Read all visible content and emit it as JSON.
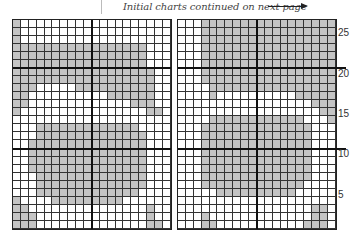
{
  "caption": {
    "text": "Initial charts continued on next page",
    "arrow": "right-arrow"
  },
  "colors": {
    "filled": "#c4c4c4",
    "empty": "#ffffff",
    "grid": "#333333"
  },
  "chart_data": [
    {
      "type": "table",
      "name": "left-chart",
      "columns": 20,
      "rows": 26,
      "legend": {
        "1": "filled (gray)",
        "0": "empty (white)"
      },
      "grid_top_to_bottom": [
        "10000000000000000000",
        "10000000000000000000",
        "10000000000000000000",
        "11111111111111111000",
        "11111111111111111000",
        "11111111111111111000",
        "11111111111111111100",
        "11111111111111111100",
        "11100000111111111100",
        "11000000000011111100",
        "11000000000000011100",
        "10000000000000000110",
        "00000000000000000000",
        "00011111111111110000",
        "00011111111111111000",
        "00111111111111111000",
        "00111111111111111000",
        "00111111111111111000",
        "00111111111111111000",
        "00011111111111111000",
        "00011111111111111000",
        "00011111111111110000",
        "10000111111111000000",
        "11000000000000000100",
        "11100000000000000100",
        "11100000000000000110"
      ]
    },
    {
      "type": "table",
      "name": "right-chart",
      "columns": 20,
      "rows": 26,
      "row_labels": {
        "25": "25",
        "20": "20",
        "15": "15",
        "10": "10",
        "5": "5"
      },
      "legend": {
        "1": "filled (gray)",
        "0": "empty (white)"
      },
      "grid_top_to_bottom": [
        "00011111111111111111",
        "00011111111111111111",
        "00011111111111111111",
        "00011111111111111111",
        "00011111111111111111",
        "00011111111111111111",
        "00011111111111111111",
        "00011111111111111111",
        "00001111111111111111",
        "00001000000000011111",
        "00000000000000000111",
        "00000000000000000011",
        "00001111111111110001",
        "00011111111111111000",
        "00011111111111111000",
        "00011111111111111000",
        "00011111111111111000",
        "00011111111111111000",
        "00011111111111111000",
        "00011111111111111000",
        "00011111111111110000",
        "00000111111111100000",
        "00000000000000000000",
        "00000000000000000110",
        "00010000000000000110",
        "00011000000000001110"
      ]
    }
  ]
}
